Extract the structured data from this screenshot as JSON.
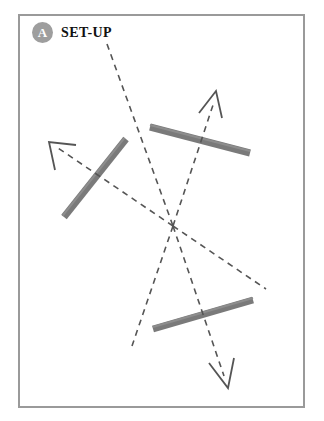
{
  "figure": {
    "label": {
      "badge": "A",
      "title": "SET-UP"
    },
    "panel": {
      "background_color": "#ffffff",
      "border_color": "#9a9a9a",
      "x": 18,
      "y": 14,
      "width": 287,
      "height": 394
    },
    "colors": {
      "mirror": "#7a7a7a",
      "mirror_edge": "#6a6a6a",
      "ray": "#555555",
      "badge": "#9e9e9e",
      "badge_text": "#ffffff",
      "title_text": "#111111"
    },
    "mirrors": [
      {
        "name": "mirror-left",
        "x1": 126,
        "y1": 139,
        "x2": 64,
        "y2": 217,
        "thickness": 7
      },
      {
        "name": "mirror-top-right",
        "x1": 150,
        "y1": 127,
        "x2": 250,
        "y2": 153,
        "thickness": 7
      },
      {
        "name": "mirror-bottom",
        "x1": 153,
        "y1": 329,
        "x2": 253,
        "y2": 300,
        "thickness": 7
      }
    ],
    "rays": [
      {
        "name": "ray-incoming-top",
        "points": "107,44 173,226",
        "arrow": false
      },
      {
        "name": "ray-to-upper-left-arrow",
        "points": "173,226 56,147",
        "arrow": true,
        "arrow_tip_x": 49,
        "arrow_tip_y": 142
      },
      {
        "name": "ray-to-upper-right-arrow",
        "points": "173,226 214,100",
        "arrow": true,
        "arrow_tip_x": 216,
        "arrow_tip_y": 91
      },
      {
        "name": "ray-to-lower-right-arrow",
        "points": "173,226 224,377",
        "arrow": true,
        "arrow_tip_x": 228,
        "arrow_tip_y": 388
      },
      {
        "name": "ray-to-right-edge",
        "points": "173,226 266,289",
        "arrow": false
      },
      {
        "name": "ray-to-lower-left",
        "points": "173,226 132,346",
        "arrow": false
      }
    ],
    "dash_pattern": "6 5"
  }
}
